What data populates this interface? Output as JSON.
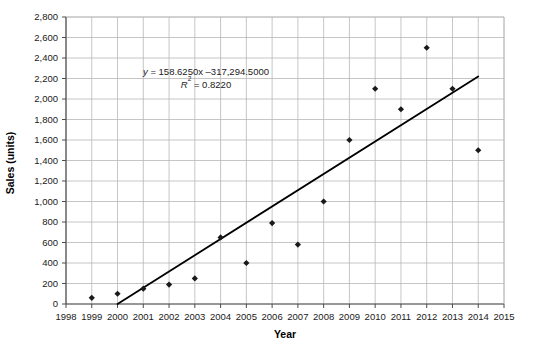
{
  "chart_data": {
    "type": "scatter",
    "title": "",
    "xlabel": "Year",
    "ylabel": "Sales (units)",
    "xlim": [
      1998,
      2015
    ],
    "ylim": [
      0,
      2800
    ],
    "grid": true,
    "legend": "none",
    "x": [
      1999,
      2000,
      2001,
      2002,
      2003,
      2004,
      2005,
      2006,
      2007,
      2008,
      2009,
      2010,
      2011,
      2012,
      2013,
      2014
    ],
    "values": [
      60,
      100,
      150,
      190,
      250,
      650,
      400,
      790,
      580,
      1000,
      1600,
      2100,
      1900,
      2500,
      2100,
      1500
    ],
    "series": [
      {
        "name": "Sales",
        "marker": "diamond",
        "color": "#1a1a1a",
        "points": [
          {
            "x": 1999,
            "y": 60
          },
          {
            "x": 2000,
            "y": 100
          },
          {
            "x": 2001,
            "y": 150
          },
          {
            "x": 2002,
            "y": 190
          },
          {
            "x": 2003,
            "y": 250
          },
          {
            "x": 2004,
            "y": 650
          },
          {
            "x": 2005,
            "y": 400
          },
          {
            "x": 2006,
            "y": 790
          },
          {
            "x": 2007,
            "y": 580
          },
          {
            "x": 2008,
            "y": 1000
          },
          {
            "x": 2009,
            "y": 1600
          },
          {
            "x": 2010,
            "y": 2100
          },
          {
            "x": 2011,
            "y": 1900
          },
          {
            "x": 2012,
            "y": 2500
          },
          {
            "x": 2013,
            "y": 2100
          },
          {
            "x": 2014,
            "y": 1500
          }
        ]
      }
    ],
    "trendline": {
      "type": "linear",
      "slope": 158.625,
      "intercept": -317294.5,
      "color": "#000000",
      "x_start": 2000,
      "x_end": 2014,
      "y_start": 0,
      "y_end": 2220
    },
    "annotations": {
      "equation": "y = 158.6250x –317,294.5000",
      "equation_lhs": "y",
      "equation_rhs": " = 158.6250x –317,294.5000",
      "r_squared_symbol": "R",
      "r_squared_exponent": "2",
      "r_squared_value": " = 0.8220",
      "r_squared": "R² = 0.8220"
    },
    "xticks": [
      1998,
      1999,
      2000,
      2001,
      2002,
      2003,
      2004,
      2005,
      2006,
      2007,
      2008,
      2009,
      2010,
      2011,
      2012,
      2013,
      2014,
      2015
    ],
    "xtick_labels": [
      "1998",
      "1999",
      "2000",
      "2001",
      "2002",
      "2003",
      "2004",
      "2005",
      "2006",
      "2007",
      "2008",
      "2009",
      "2010",
      "2011",
      "2012",
      "2013",
      "2014",
      "2015"
    ],
    "yticks": [
      0,
      200,
      400,
      600,
      800,
      1000,
      1200,
      1400,
      1600,
      1800,
      2000,
      2200,
      2400,
      2600,
      2800
    ],
    "ytick_labels": [
      "0",
      "200",
      "400",
      "600",
      "800",
      "1,000",
      "1,200",
      "1,400",
      "1,600",
      "1,800",
      "2,000",
      "2,200",
      "2,400",
      "2,600",
      "2,800"
    ],
    "colors": {
      "marker": "#1a1a1a",
      "trendline": "#000000",
      "grid": "#b8b8b8",
      "axis": "#4d4d4d",
      "background": "#ffffff"
    }
  }
}
